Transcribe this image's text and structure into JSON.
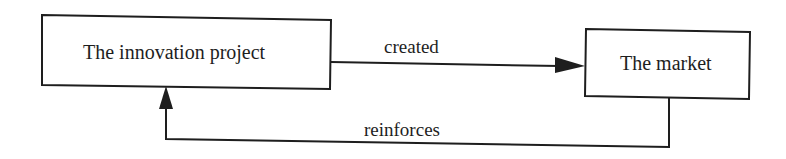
{
  "diagram": {
    "nodes": [
      {
        "id": "innovation-project",
        "label": "The innovation project"
      },
      {
        "id": "market",
        "label": "The market"
      }
    ],
    "edges": [
      {
        "from": "innovation-project",
        "to": "market",
        "label": "created"
      },
      {
        "from": "market",
        "to": "innovation-project",
        "label": "reinforces"
      }
    ],
    "colors": {
      "stroke": "#1e1e1e",
      "background": "#ffffff"
    }
  }
}
